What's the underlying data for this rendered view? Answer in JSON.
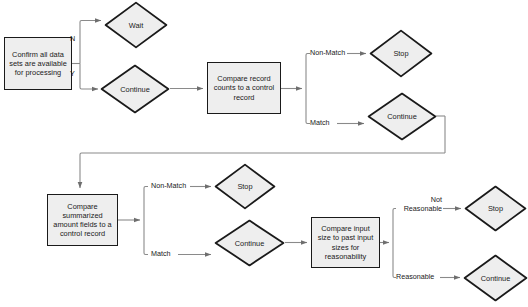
{
  "diagram": {
    "type": "flowchart",
    "colors": {
      "node_fill": "#eeeeee",
      "node_stroke": "#1a1a1a",
      "connector": "#8a8a8a",
      "text": "#1a1a1a",
      "background": "#ffffff"
    },
    "nodes": [
      {
        "id": "confirm",
        "shape": "process",
        "label": "Confirm all data sets are available for processing"
      },
      {
        "id": "wait1",
        "shape": "decision",
        "label": "Wait"
      },
      {
        "id": "continue1",
        "shape": "decision",
        "label": "Continue"
      },
      {
        "id": "compare_counts",
        "shape": "process",
        "label": "Compare record counts to a control record"
      },
      {
        "id": "stop1",
        "shape": "decision",
        "label": "Stop"
      },
      {
        "id": "continue2",
        "shape": "decision",
        "label": "Continue"
      },
      {
        "id": "compare_amounts",
        "shape": "process",
        "label": "Compare summarized amount fields to a control record"
      },
      {
        "id": "stop2",
        "shape": "decision",
        "label": "Stop"
      },
      {
        "id": "continue3",
        "shape": "decision",
        "label": "Continue"
      },
      {
        "id": "compare_size",
        "shape": "process",
        "label": "Compare input size to past input sizes for reasonability"
      },
      {
        "id": "stop3",
        "shape": "decision",
        "label": "Stop"
      },
      {
        "id": "continue4",
        "shape": "decision",
        "label": "Continue"
      }
    ],
    "edge_labels": {
      "no": "N",
      "yes": "Y",
      "non_match_1": "Non-Match",
      "match_1": "Match",
      "non_match_2": "Non-Match",
      "match_2": "Match",
      "not_reasonable_line1": "Not",
      "not_reasonable_line2": "Reasonable",
      "reasonable": "Reasonable"
    },
    "edges": [
      {
        "from": "confirm",
        "to": "wait1",
        "label": "N"
      },
      {
        "from": "confirm",
        "to": "continue1",
        "label": "Y"
      },
      {
        "from": "continue1",
        "to": "compare_counts",
        "label": ""
      },
      {
        "from": "compare_counts",
        "to": "stop1",
        "label": "Non-Match"
      },
      {
        "from": "compare_counts",
        "to": "continue2",
        "label": "Match"
      },
      {
        "from": "continue2",
        "to": "compare_amounts",
        "label": ""
      },
      {
        "from": "compare_amounts",
        "to": "stop2",
        "label": "Non-Match"
      },
      {
        "from": "compare_amounts",
        "to": "continue3",
        "label": "Match"
      },
      {
        "from": "continue3",
        "to": "compare_size",
        "label": ""
      },
      {
        "from": "compare_size",
        "to": "stop3",
        "label": "Not Reasonable"
      },
      {
        "from": "compare_size",
        "to": "continue4",
        "label": "Reasonable"
      }
    ]
  }
}
